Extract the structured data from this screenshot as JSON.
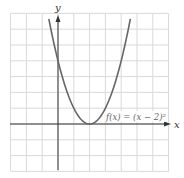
{
  "chart_data": {
    "type": "line",
    "title": "",
    "xlabel": "x",
    "ylabel": "y",
    "xlim": [
      -3,
      7
    ],
    "ylim": [
      -3,
      7
    ],
    "grid": true,
    "grid_step": 1,
    "tick_labels_shown": false,
    "series": [
      {
        "name": "f(x) = (x − 2)²",
        "function": "(x-2)^2",
        "x": [
          -0.6,
          0,
          1,
          2,
          3,
          4,
          4.6
        ],
        "values": [
          6.76,
          4,
          1,
          0,
          1,
          4,
          6.76
        ],
        "color": "#666666"
      }
    ],
    "annotations": [
      {
        "text": "f(x) = (x − 2)²",
        "x": 3.6,
        "y": 0.5
      }
    ]
  },
  "labels": {
    "x_axis": "x",
    "y_axis": "y",
    "function": "f(x) = (x − 2)²"
  },
  "colors": {
    "grid": "#d9d9d9",
    "axis": "#333333",
    "curve": "#666666",
    "background": "#ffffff"
  }
}
